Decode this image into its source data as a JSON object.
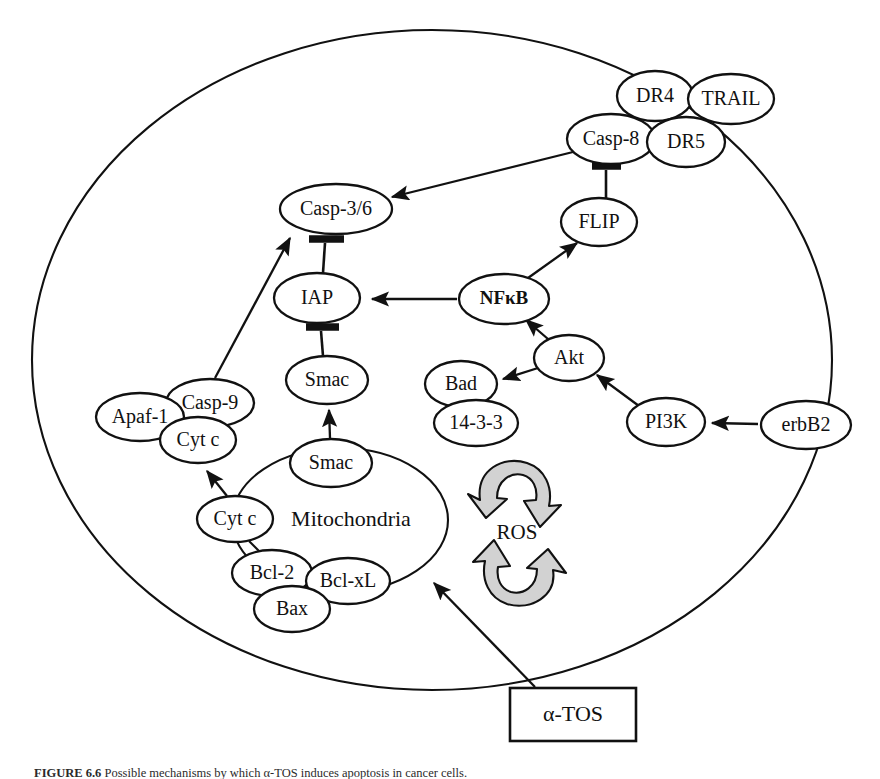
{
  "figure": {
    "domain": "Diagram",
    "caption_prefix": "FIGURE 6.6",
    "caption_text": "Possible mechanisms by which α-TOS induces apoptosis in cancer cells.",
    "background_color": "#ffffff",
    "line_color": "#111111",
    "ros_arrow_fill": "#d2d2d2"
  },
  "compartments": {
    "cell": {
      "label": "",
      "name": "cell-membrane"
    },
    "mitochondria": {
      "label": "Mitochondria",
      "name": "mitochondria-organelle"
    }
  },
  "ros": {
    "label": "ROS",
    "description": "reactive oxygen species cycle"
  },
  "treatment": {
    "label": "α-TOS",
    "name": "alpha-tos-box"
  },
  "nodes": [
    {
      "id": "dr4",
      "label": "DR4",
      "x": 655,
      "y": 96,
      "rx": 38,
      "ry": 25,
      "style": "normal"
    },
    {
      "id": "trail",
      "label": "TRAIL",
      "x": 731,
      "y": 99,
      "rx": 43,
      "ry": 25,
      "style": "normal"
    },
    {
      "id": "casp8",
      "label": "Casp-8",
      "x": 611,
      "y": 139,
      "rx": 44,
      "ry": 25,
      "style": "normal"
    },
    {
      "id": "dr5",
      "label": "DR5",
      "x": 686,
      "y": 142,
      "rx": 39,
      "ry": 25,
      "style": "normal"
    },
    {
      "id": "casp36",
      "label": "Casp-3/6",
      "x": 336,
      "y": 209,
      "rx": 56,
      "ry": 25,
      "style": "normal"
    },
    {
      "id": "flip",
      "label": "FLIP",
      "x": 599,
      "y": 222,
      "rx": 38,
      "ry": 24,
      "style": "normal"
    },
    {
      "id": "iap",
      "label": "IAP",
      "x": 317,
      "y": 298,
      "rx": 43,
      "ry": 25,
      "style": "normal"
    },
    {
      "id": "nfkb",
      "label": "NFκB",
      "x": 504,
      "y": 299,
      "rx": 45,
      "ry": 25,
      "style": "bold"
    },
    {
      "id": "akt",
      "label": "Akt",
      "x": 569,
      "y": 358,
      "rx": 35,
      "ry": 23,
      "style": "normal"
    },
    {
      "id": "smac_top",
      "label": "Smac",
      "x": 327,
      "y": 380,
      "rx": 41,
      "ry": 24,
      "style": "normal"
    },
    {
      "id": "bad",
      "label": "Bad",
      "x": 461,
      "y": 384,
      "rx": 36,
      "ry": 23,
      "style": "normal"
    },
    {
      "id": "casp9",
      "label": "Casp-9",
      "x": 210,
      "y": 403,
      "rx": 44,
      "ry": 24,
      "style": "normal"
    },
    {
      "id": "apaf1",
      "label": "Apaf-1",
      "x": 140,
      "y": 417,
      "rx": 44,
      "ry": 24,
      "style": "normal"
    },
    {
      "id": "pi3k",
      "label": "PI3K",
      "x": 666,
      "y": 422,
      "rx": 39,
      "ry": 24,
      "style": "normal"
    },
    {
      "id": "erbb2",
      "label": "erbB2",
      "x": 806,
      "y": 425,
      "rx": 45,
      "ry": 24,
      "style": "normal"
    },
    {
      "id": "1433",
      "label": "14-3-3",
      "x": 476,
      "y": 423,
      "rx": 42,
      "ry": 23,
      "style": "normal"
    },
    {
      "id": "cytc_top",
      "label": "Cyt c",
      "x": 198,
      "y": 440,
      "rx": 38,
      "ry": 23,
      "style": "normal"
    },
    {
      "id": "smac_mid",
      "label": "Smac",
      "x": 331,
      "y": 463,
      "rx": 41,
      "ry": 24,
      "style": "normal"
    },
    {
      "id": "cytc_mid",
      "label": "Cyt c",
      "x": 235,
      "y": 519,
      "rx": 38,
      "ry": 23,
      "style": "normal"
    },
    {
      "id": "bcl2",
      "label": "Bcl-2",
      "x": 272,
      "y": 573,
      "rx": 40,
      "ry": 23,
      "style": "normal"
    },
    {
      "id": "bclxl",
      "label": "Bcl-xL",
      "x": 348,
      "y": 581,
      "rx": 42,
      "ry": 23,
      "style": "normal"
    },
    {
      "id": "bax",
      "label": "Bax",
      "x": 292,
      "y": 609,
      "rx": 38,
      "ry": 23,
      "style": "normal"
    }
  ],
  "edges": [
    {
      "id": "casp8-casp36",
      "from": "Casp-8",
      "to": "Casp-3/6",
      "type": "activation"
    },
    {
      "id": "casp8-flip",
      "from": "FLIP",
      "to": "Casp-8",
      "type": "inhibition"
    },
    {
      "id": "nfkb-flip",
      "from": "NFκB",
      "to": "FLIP",
      "type": "activation"
    },
    {
      "id": "nfkb-iap",
      "from": "NFκB",
      "to": "IAP",
      "type": "activation"
    },
    {
      "id": "iap-casp36",
      "from": "IAP",
      "to": "Casp-3/6",
      "type": "inhibition"
    },
    {
      "id": "smac-iap",
      "from": "Smac",
      "to": "IAP",
      "type": "inhibition"
    },
    {
      "id": "smac-smac",
      "from": "Smac",
      "to": "Smac",
      "type": "activation"
    },
    {
      "id": "casp9-casp36",
      "from": "Casp-9",
      "to": "Casp-3/6",
      "type": "activation"
    },
    {
      "id": "cytc-cytc",
      "from": "Cyt c",
      "to": "Cyt c",
      "type": "activation"
    },
    {
      "id": "akt-nfkb",
      "from": "Akt",
      "to": "NFκB",
      "type": "activation"
    },
    {
      "id": "akt-bad",
      "from": "Akt",
      "to": "Bad",
      "type": "activation"
    },
    {
      "id": "pi3k-akt",
      "from": "PI3K",
      "to": "Akt",
      "type": "activation"
    },
    {
      "id": "erbb2-pi3k",
      "from": "erbB2",
      "to": "PI3K",
      "type": "activation"
    },
    {
      "id": "atos-mito",
      "from": "α-TOS",
      "to": "Mitochondria",
      "type": "activation"
    }
  ]
}
